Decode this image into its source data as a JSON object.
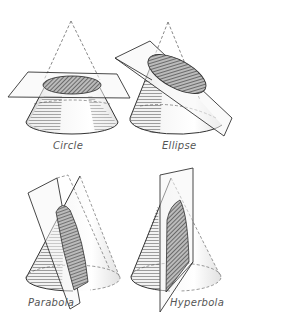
{
  "diagram": {
    "panels": [
      {
        "id": "circle",
        "label": "Circle",
        "description": "Horizontal plane cutting a cone parallel to its base"
      },
      {
        "id": "ellipse",
        "label": "Ellipse",
        "description": "Tilted plane cutting all elements of the cone"
      },
      {
        "id": "parabola",
        "label": "Parabola",
        "description": "Plane parallel to one element of the cone"
      },
      {
        "id": "hyperbola",
        "label": "Hyperbola",
        "description": "Vertical plane parallel to the cone axis"
      }
    ],
    "colors": {
      "line": "#333333",
      "dashed": "#555555",
      "hatch": "#444444",
      "cone_fill": "#eeeeee",
      "plane_fill": "#f4f4f4",
      "label": "#555555"
    }
  }
}
